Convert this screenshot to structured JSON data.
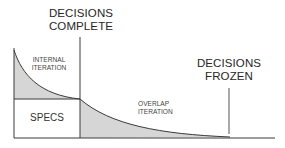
{
  "diagram": {
    "labels": {
      "decisions_complete": [
        "DECISIONS",
        "COMPLETE"
      ],
      "decisions_frozen": [
        "DECISIONS",
        "FROZEN"
      ],
      "internal_iteration": [
        "INTERNAL",
        "ITERATION"
      ],
      "overlap_iteration": [
        "OVERLAP",
        "ITERATION"
      ],
      "specs": "SPECS"
    },
    "colors": {
      "line": "#3a3a3a",
      "fill": "#d6d6d6",
      "background": "#ffffff"
    }
  }
}
